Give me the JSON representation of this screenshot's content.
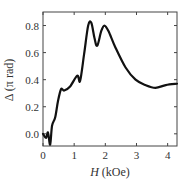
{
  "chart_data": {
    "type": "line",
    "title": "",
    "xlabel": "H (kOe)",
    "xlabel_italic_part": "H",
    "xlabel_unit": "(kOe)",
    "ylabel": "Δ (π rad)",
    "xlim": [
      0,
      4.3
    ],
    "ylim": [
      -0.09,
      0.9
    ],
    "xticks": [
      0,
      1,
      2,
      3,
      4
    ],
    "yticks": [
      0.0,
      0.2,
      0.4,
      0.6,
      0.8
    ],
    "xtick_labels": [
      "0",
      "1",
      "2",
      "3",
      "4"
    ],
    "ytick_labels": [
      "0.0",
      "0.2",
      "0.4",
      "0.6",
      "0.8"
    ],
    "grid": false,
    "legend": null,
    "series": [
      {
        "name": "Δ",
        "color": "#111111",
        "x": [
          0,
          0.1,
          0.16,
          0.23,
          0.29,
          0.39,
          0.48,
          0.58,
          0.68,
          0.87,
          1.1,
          1.19,
          1.32,
          1.45,
          1.55,
          1.65,
          1.74,
          1.87,
          1.97,
          2.1,
          2.32,
          2.65,
          2.97,
          3.29,
          3.61,
          3.94,
          4.3
        ],
        "y": [
          0.0,
          -0.03,
          0.01,
          -0.08,
          0.06,
          0.12,
          0.24,
          0.33,
          0.32,
          0.35,
          0.43,
          0.39,
          0.59,
          0.8,
          0.82,
          0.71,
          0.65,
          0.76,
          0.8,
          0.76,
          0.64,
          0.49,
          0.4,
          0.36,
          0.34,
          0.36,
          0.37
        ]
      }
    ]
  }
}
